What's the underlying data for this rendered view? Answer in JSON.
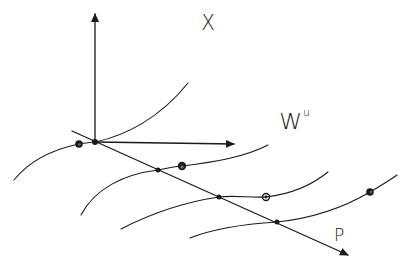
{
  "figure": {
    "type": "hand-drawn sketch of an unstable manifold foliation",
    "labels": {
      "x_axis": "X",
      "manifold_base": "W",
      "manifold_superscript": "u",
      "p_axis": "P"
    },
    "colors": {
      "ink": "#1a1a1a",
      "background": "#ffffff"
    },
    "axes": {
      "vertical": {
        "from": [
          95,
          143
        ],
        "to": [
          95,
          12
        ]
      },
      "horizontal": {
        "from": [
          95,
          142
        ],
        "to": [
          236,
          144
        ]
      },
      "diagonal_p": {
        "from": [
          72,
          131
        ],
        "to": [
          350,
          256
        ]
      }
    },
    "leaves": [
      {
        "name": "leaf-1",
        "intersection": [
          95,
          142
        ],
        "marked_point": [
          79,
          144
        ]
      },
      {
        "name": "leaf-2",
        "intersection": [
          158,
          170
        ],
        "marked_point": [
          182,
          166
        ]
      },
      {
        "name": "leaf-3",
        "intersection": [
          219,
          197
        ],
        "marked_point": [
          266,
          197
        ]
      },
      {
        "name": "leaf-4",
        "intersection": [
          277,
          222
        ],
        "marked_point": [
          370,
          192
        ]
      }
    ]
  }
}
